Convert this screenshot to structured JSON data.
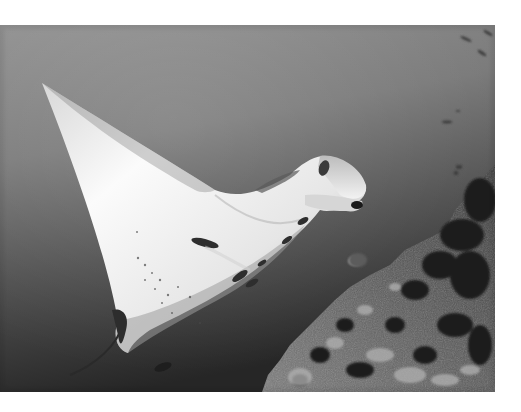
{
  "image": {
    "alt": "Grayscale underwater photograph of a manta ray gliding beside a coral reef slope",
    "subject": "manta ray",
    "colors": {
      "page_background": "#ffffff",
      "water_top": "#8e8e8e",
      "water_mid": "#5e5e5e",
      "water_bottom": "#2a2a2a",
      "manta_belly": "#f4f4f4",
      "manta_shadow": "#9a9a9a",
      "reef_light": "#9c9c9c",
      "reef_dark": "#1e1e1e"
    }
  }
}
